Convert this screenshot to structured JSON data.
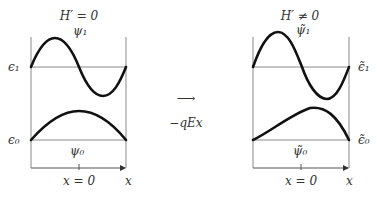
{
  "left_panel": {
    "title": "H′ = 0",
    "state1_label": "ψ₁",
    "state0_label": "ψ₀",
    "energy1_label": "ϵ₁",
    "energy0_label": "ϵ₀",
    "x_tick_label": "x = 0",
    "x_axis_label": "x"
  },
  "transition": {
    "arrow": "⟶",
    "label": "−qEx"
  },
  "right_panel": {
    "title": "H′ ≠ 0",
    "state1_label": "ψ̃₁",
    "state0_label": "ψ̃₀",
    "energy1_label": "ϵ̃₁",
    "energy0_label": "ϵ̃₀",
    "x_tick_label": "x = 0",
    "x_axis_label": "x"
  },
  "colors": {
    "curve": "#111111",
    "frame": "#8a8a8a",
    "text": "#333333"
  }
}
